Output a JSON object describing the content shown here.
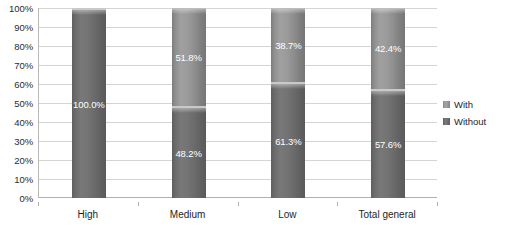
{
  "chart_data": {
    "type": "bar",
    "subtype": "stacked-percent-cylinder",
    "title": "",
    "xlabel": "",
    "ylabel": "",
    "categories": [
      "High",
      "Medium",
      "Low",
      "Total general"
    ],
    "series": [
      {
        "name": "With",
        "values": [
          0.0,
          51.8,
          38.7,
          42.4
        ],
        "labels": [
          "",
          "51.8%",
          "38.7%",
          "42.4%"
        ],
        "color": "#8f8f8f"
      },
      {
        "name": "Without",
        "values": [
          100.0,
          48.2,
          61.3,
          57.6
        ],
        "labels": [
          "100.0%",
          "48.2%",
          "61.3%",
          "57.6%"
        ],
        "color": "#6b6b6b"
      }
    ],
    "ylim": [
      0,
      100
    ],
    "y_ticks": [
      0,
      10,
      20,
      30,
      40,
      50,
      60,
      70,
      80,
      90,
      100
    ],
    "y_tick_labels": [
      "0%",
      "10%",
      "20%",
      "30%",
      "40%",
      "50%",
      "60%",
      "70%",
      "80%",
      "90%",
      "100%"
    ],
    "grid": true,
    "legend_position": "right",
    "legend_entries": [
      "With",
      "Without"
    ]
  },
  "legend": {
    "items": [
      {
        "label": "With",
        "swatch": "legend-swatch-with"
      },
      {
        "label": "Without",
        "swatch": "legend-swatch-without"
      }
    ]
  }
}
